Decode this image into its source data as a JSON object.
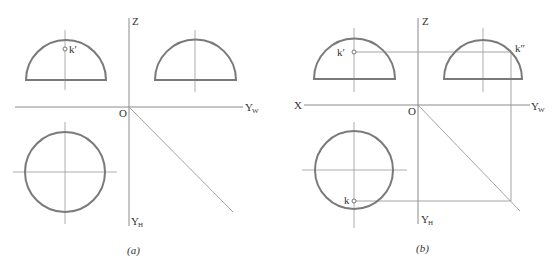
{
  "panel_a": {
    "caption": "(a)",
    "labels": {
      "z": "Z",
      "origin": "O",
      "yw": "Y",
      "yw_sub": "W",
      "yh": "Y",
      "yh_sub": "H",
      "k_prime": "k′"
    }
  },
  "panel_b": {
    "caption": "(b)",
    "labels": {
      "z": "Z",
      "x": "X",
      "origin": "O",
      "yw": "Y",
      "yw_sub": "W",
      "yh": "Y",
      "yh_sub": "H",
      "k_prime": "k′",
      "k_double_prime": "k″",
      "k": "k"
    }
  },
  "colors": {
    "shape_stroke": "#7a7a7a",
    "axis_stroke": "#8a8a8a",
    "background": "#ffffff"
  }
}
